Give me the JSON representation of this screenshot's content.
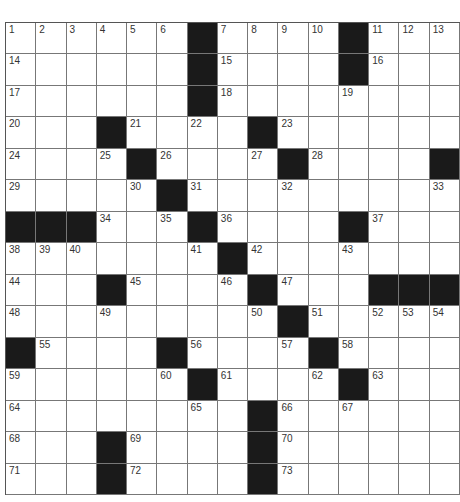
{
  "puzzle": {
    "rows": 15,
    "cols": 15,
    "colors": {
      "block": "#1a1a1a",
      "cell": "#ffffff",
      "line": "#777777",
      "number": "#333333"
    },
    "grid": [
      [
        "1",
        "2",
        "3",
        "4",
        "5",
        "6",
        "#",
        "7",
        "8",
        "9",
        "10",
        "#",
        "11",
        "12",
        "13"
      ],
      [
        "14",
        "",
        "",
        "",
        "",
        "",
        "#",
        "15",
        "",
        "",
        "",
        "#",
        "16",
        "",
        ""
      ],
      [
        "17",
        "",
        "",
        "",
        "",
        "",
        "#",
        "18",
        "",
        "",
        "",
        "19",
        "",
        "",
        ""
      ],
      [
        "20",
        "",
        "",
        "#",
        "21",
        "",
        "22",
        "",
        "#",
        "23",
        "",
        "",
        "",
        "",
        ""
      ],
      [
        "24",
        "",
        "",
        "25",
        "#",
        "26",
        "",
        "",
        "27",
        "#",
        "28",
        "",
        "",
        "",
        "#"
      ],
      [
        "29",
        "",
        "",
        "",
        "30",
        "#",
        "31",
        "",
        "",
        "32",
        "",
        "",
        "",
        "",
        "33"
      ],
      [
        "#",
        "#",
        "#",
        "34",
        "",
        "35",
        "#",
        "36",
        "",
        "",
        "",
        "#",
        "37",
        "",
        ""
      ],
      [
        "38",
        "39",
        "40",
        "",
        "",
        "",
        "41",
        "#",
        "42",
        "",
        "",
        "43",
        "",
        "",
        ""
      ],
      [
        "44",
        "",
        "",
        "#",
        "45",
        "",
        "",
        "46",
        "#",
        "47",
        "",
        "",
        "#",
        "#",
        "#"
      ],
      [
        "48",
        "",
        "",
        "49",
        "",
        "",
        "",
        "",
        "50",
        "#",
        "51",
        "",
        "52",
        "53",
        "54"
      ],
      [
        "#",
        "55",
        "",
        "",
        "",
        "#",
        "56",
        "",
        "",
        "57",
        "#",
        "58",
        "",
        "",
        ""
      ],
      [
        "59",
        "",
        "",
        "",
        "",
        "60",
        "#",
        "61",
        "",
        "",
        "62",
        "#",
        "63",
        "",
        ""
      ],
      [
        "64",
        "",
        "",
        "",
        "",
        "",
        "65",
        "",
        "#",
        "66",
        "",
        "67",
        "",
        "",
        ""
      ],
      [
        "68",
        "",
        "",
        "#",
        "69",
        "",
        "",
        "",
        "#",
        "70",
        "",
        "",
        "",
        "",
        ""
      ],
      [
        "71",
        "",
        "",
        "#",
        "72",
        "",
        "",
        "",
        "#",
        "73",
        "",
        "",
        "",
        "",
        ""
      ]
    ]
  }
}
